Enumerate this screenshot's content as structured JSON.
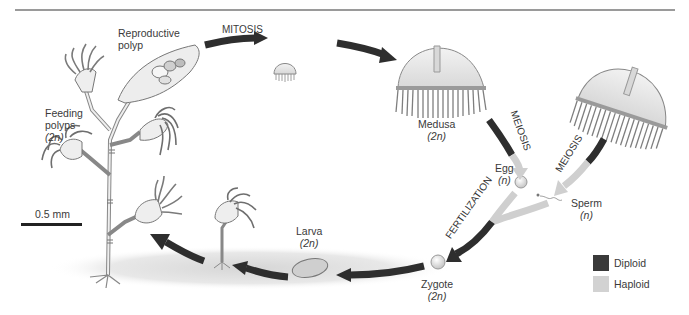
{
  "figure": {
    "title_rule": true,
    "labels": {
      "reproductive_polyp": [
        "Reproductive",
        "polyp"
      ],
      "feeding_polyps": [
        "Feeding",
        "polyps",
        "(2n)"
      ],
      "mitosis": "MITOSIS",
      "medusa": [
        "Medusa",
        "(2n)"
      ],
      "meiosis_female": "MEIOSIS",
      "meiosis_male": "MEIOSIS",
      "egg": [
        "Egg",
        "(n)"
      ],
      "sperm": [
        "Sperm",
        "(n)"
      ],
      "fertilization": "FERTILIZATION",
      "zygote": [
        "Zygote",
        "(2n)"
      ],
      "larva": [
        "Larva",
        "(2n)"
      ],
      "scale_bar": "0.5 mm"
    },
    "legend": [
      {
        "label": "Diploid",
        "color": "#3a3a3a"
      },
      {
        "label": "Haploid",
        "color": "#d2d2d2"
      }
    ],
    "colors": {
      "diploid_arrow": "#2e2e2e",
      "haploid_arrow": "#cfcfcf",
      "outline": "#6a6a6a",
      "body_fill": "#ececec",
      "tentacle": "#8a8a8a"
    }
  }
}
